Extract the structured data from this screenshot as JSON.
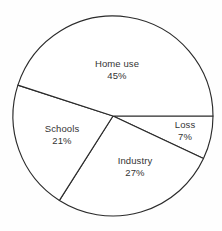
{
  "chart_data": {
    "type": "pie",
    "title": "",
    "subtitle": "",
    "xlabel": "",
    "ylabel": "",
    "legend": "none",
    "grid": false,
    "units": "percent",
    "start_angle_deg": 0,
    "direction": "clockwise",
    "categories": [
      "Loss",
      "Industry",
      "Schools",
      "Home use"
    ],
    "values": [
      7,
      27,
      21,
      45
    ],
    "slices": [
      {
        "label": "Loss",
        "value": 7,
        "value_text": "7%",
        "start_deg": 0,
        "end_deg": 25.2,
        "label_x": 185,
        "label_y": 130
      },
      {
        "label": "Industry",
        "value": 27,
        "value_text": "27%",
        "start_deg": 25.2,
        "end_deg": 122.4,
        "label_x": 135,
        "label_y": 166
      },
      {
        "label": "Schools",
        "value": 21,
        "value_text": "21%",
        "start_deg": 122.4,
        "end_deg": 198.0,
        "label_x": 62,
        "label_y": 134
      },
      {
        "label": "Home use",
        "value": 45,
        "value_text": "45%",
        "start_deg": 198.0,
        "end_deg": 360.0,
        "label_x": 117,
        "label_y": 69
      }
    ],
    "geometry": {
      "center_x": 113,
      "center_y": 116,
      "radius": 100
    },
    "colors": {
      "background": "#fefefe",
      "slice_fill": "#ffffff",
      "outline": "#2b2b2b",
      "label_text": "#343434"
    }
  }
}
